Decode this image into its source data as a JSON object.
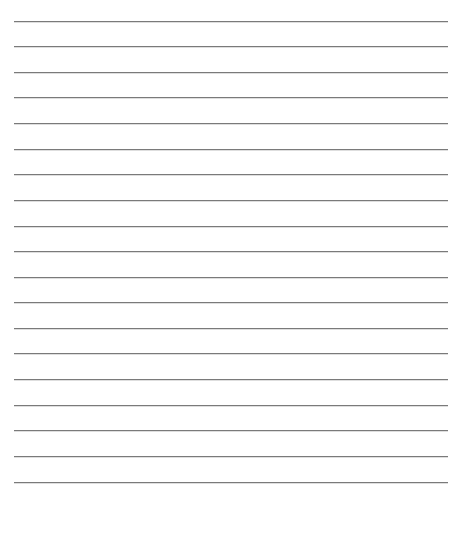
{
  "document": {
    "type": "lined-paper",
    "line_count": 19,
    "line_color": "#7a7a7a",
    "background": "#ffffff",
    "lines_y": [
      21,
      46,
      72,
      97,
      123,
      149,
      174,
      200,
      226,
      251,
      277,
      302,
      328,
      353,
      379,
      405,
      430,
      456,
      482
    ]
  }
}
